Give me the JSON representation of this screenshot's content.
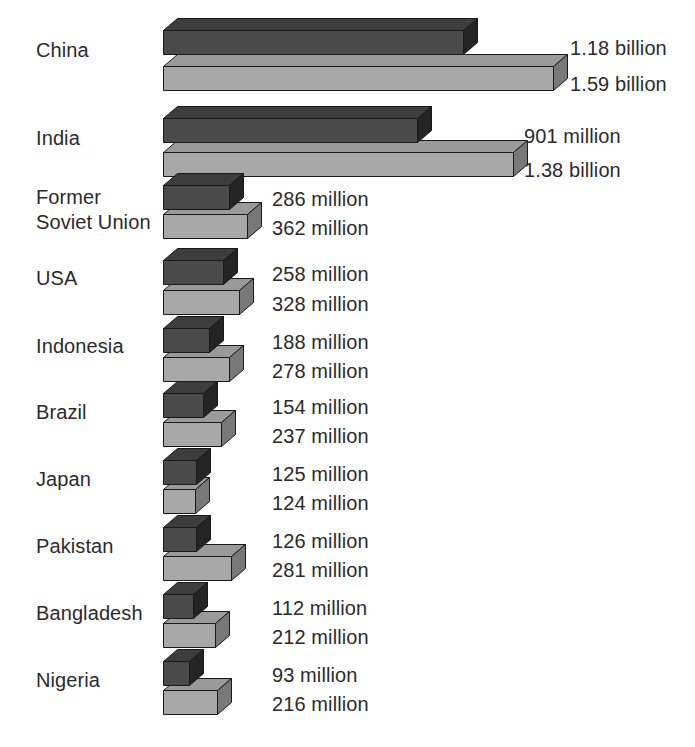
{
  "chart_data": {
    "type": "bar",
    "title": "",
    "subtitle": "",
    "xlabel": "",
    "ylabel": "",
    "orientation": "horizontal",
    "grid": false,
    "legend_position": "none",
    "categories": [
      "China",
      "India",
      "Former\nSoviet Union",
      "USA",
      "Indonesia",
      "Brazil",
      "Japan",
      "Pakistan",
      "Bangladesh",
      "Nigeria"
    ],
    "series": [
      {
        "name": "Current population",
        "color": "#4a4a4a",
        "values": [
          1180,
          901,
          286,
          258,
          188,
          154,
          125,
          126,
          112,
          93
        ],
        "labels": [
          "1.18 billion",
          "901 million",
          "286 million",
          "258 million",
          "188 million",
          "154 million",
          "125 million",
          "126 million",
          "112 million",
          "93 million"
        ]
      },
      {
        "name": "Projected population",
        "color": "#a8a8a8",
        "values": [
          1590,
          1380,
          362,
          328,
          278,
          237,
          124,
          281,
          212,
          216
        ],
        "labels": [
          "1.59 billion",
          "1.38 billion",
          "362 million",
          "328 million",
          "278 million",
          "237 million",
          "124 million",
          "281 million",
          "212 million",
          "216 million"
        ]
      }
    ],
    "units": "millions of people",
    "xlim": [
      0,
      1590
    ]
  },
  "rows": [
    {
      "label_lines": [
        "China"
      ],
      "label_top": 38,
      "dark": {
        "value_label": "1.18 billion",
        "top": 30,
        "width": 300,
        "left": 163
      },
      "light": {
        "value_label": "1.59 billion",
        "top": 66,
        "width": 390,
        "left": 163
      },
      "dark_label_x": 570,
      "dark_label_y": 38,
      "light_label_x": 570,
      "light_label_y": 74
    },
    {
      "label_lines": [
        "India"
      ],
      "label_top": 126,
      "dark": {
        "value_label": "901 million",
        "top": 118,
        "width": 254,
        "left": 163
      },
      "light": {
        "value_label": "1.38 billion",
        "top": 152,
        "width": 350,
        "left": 163
      },
      "dark_label_x": 524,
      "dark_label_y": 126,
      "light_label_x": 524,
      "light_label_y": 160
    },
    {
      "label_lines": [
        "Former",
        "Soviet Union"
      ],
      "label_top": 185,
      "dark": {
        "value_label": "286 million",
        "top": 185,
        "width": 66,
        "left": 163
      },
      "light": {
        "value_label": "362 million",
        "top": 214,
        "width": 84,
        "left": 163
      },
      "dark_label_x": 272,
      "dark_label_y": 189,
      "light_label_x": 272,
      "light_label_y": 218
    },
    {
      "label_lines": [
        "USA"
      ],
      "label_top": 266,
      "dark": {
        "value_label": "258 million",
        "top": 260,
        "width": 60,
        "left": 163
      },
      "light": {
        "value_label": "328 million",
        "top": 290,
        "width": 76,
        "left": 163
      },
      "dark_label_x": 272,
      "dark_label_y": 264,
      "light_label_x": 272,
      "light_label_y": 294
    },
    {
      "label_lines": [
        "Indonesia"
      ],
      "label_top": 334,
      "dark": {
        "value_label": "188 million",
        "top": 328,
        "width": 46,
        "left": 163
      },
      "light": {
        "value_label": "278 million",
        "top": 357,
        "width": 66,
        "left": 163
      },
      "dark_label_x": 272,
      "dark_label_y": 332,
      "light_label_x": 272,
      "light_label_y": 361
    },
    {
      "label_lines": [
        "Brazil"
      ],
      "label_top": 400,
      "dark": {
        "value_label": "154 million",
        "top": 393,
        "width": 40,
        "left": 163
      },
      "light": {
        "value_label": "237 million",
        "top": 422,
        "width": 58,
        "left": 163
      },
      "dark_label_x": 272,
      "dark_label_y": 397,
      "light_label_x": 272,
      "light_label_y": 426
    },
    {
      "label_lines": [
        "Japan"
      ],
      "label_top": 467,
      "dark": {
        "value_label": "125 million",
        "top": 460,
        "width": 33,
        "left": 163
      },
      "light": {
        "value_label": "124 million",
        "top": 489,
        "width": 32,
        "left": 163
      },
      "dark_label_x": 272,
      "dark_label_y": 464,
      "light_label_x": 272,
      "light_label_y": 493
    },
    {
      "label_lines": [
        "Pakistan"
      ],
      "label_top": 534,
      "dark": {
        "value_label": "126 million",
        "top": 527,
        "width": 33,
        "left": 163
      },
      "light": {
        "value_label": "281 million",
        "top": 556,
        "width": 68,
        "left": 163
      },
      "dark_label_x": 272,
      "dark_label_y": 531,
      "light_label_x": 272,
      "light_label_y": 560
    },
    {
      "label_lines": [
        "Bangladesh"
      ],
      "label_top": 601,
      "dark": {
        "value_label": "112 million",
        "top": 594,
        "width": 30,
        "left": 163
      },
      "light": {
        "value_label": "212 million",
        "top": 623,
        "width": 52,
        "left": 163
      },
      "dark_label_x": 272,
      "dark_label_y": 598,
      "light_label_x": 272,
      "light_label_y": 627
    },
    {
      "label_lines": [
        "Nigeria"
      ],
      "label_top": 668,
      "dark": {
        "value_label": "93 million",
        "top": 661,
        "width": 26,
        "left": 163
      },
      "light": {
        "value_label": "216 million",
        "top": 690,
        "width": 54,
        "left": 163
      },
      "dark_label_x": 272,
      "dark_label_y": 665,
      "light_label_x": 272,
      "light_label_y": 694
    }
  ],
  "style": {
    "dark_front": "#4a4a4a",
    "dark_top": "#3d3d3d",
    "dark_side": "#242424",
    "light_front": "#a8a8a8",
    "light_top": "#9a9a9a",
    "light_side": "#787878",
    "outline": "#1a1a1a",
    "text": "#2b2b2b",
    "background": "#ffffff"
  },
  "geometry": {
    "bar_height": 24,
    "depth_x": 14,
    "depth_y": 12
  }
}
